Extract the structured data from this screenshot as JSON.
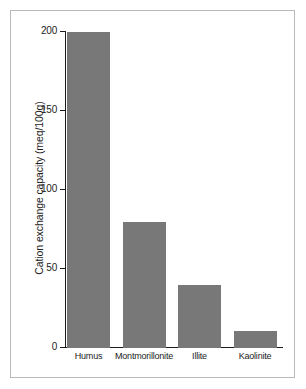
{
  "chart_data": {
    "type": "bar",
    "title": "",
    "xlabel": "",
    "ylabel": "Cation exchange capacity (meq/100g)",
    "categories": [
      "Humus",
      "Montmorillonite",
      "Illite",
      "Kaolinite"
    ],
    "values": [
      200,
      80,
      40,
      11
    ],
    "ylim": [
      0,
      200
    ],
    "yticks": [
      0,
      50,
      100,
      150,
      200
    ],
    "ytick_labels": [
      "0",
      "50",
      "100",
      "150",
      "200"
    ],
    "grid": false,
    "legend": null,
    "bar_color": "#787878",
    "axis_color": "#1c1c1c",
    "frame_color": "#b9b9b9",
    "background": "#ffffff"
  }
}
